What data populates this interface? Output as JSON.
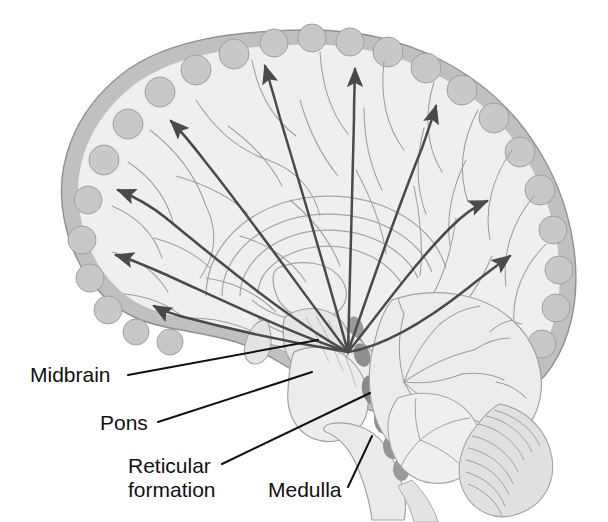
{
  "figure": {
    "view": "mid-sagittal section of the human brain",
    "background_color": "#ffffff",
    "ink_color": "#111111",
    "arrow_color": "#4a4a4a",
    "cortex_fill": "#ededed",
    "cortex_rim": "#a8a8a8",
    "brainstem_fill": "#e2e2e2",
    "nucleus_color": "#8d8d8d"
  },
  "labels": [
    {
      "id": "midbrain",
      "text": "Midbrain",
      "text_x": 30,
      "text_y": 382,
      "leader_from_x": 128,
      "leader_from_y": 375,
      "leader_to_x": 318,
      "leader_to_y": 340
    },
    {
      "id": "pons",
      "text": "Pons",
      "text_x": 100,
      "text_y": 430,
      "leader_from_x": 158,
      "leader_from_y": 422,
      "leader_to_x": 312,
      "leader_to_y": 372
    },
    {
      "id": "reticular-formation",
      "text_line1": "Reticular",
      "text_line2": "formation",
      "text_x": 128,
      "text_y": 473,
      "text_y2": 497,
      "leader_from_x": 222,
      "leader_from_y": 464,
      "leader_to_x": 370,
      "leader_to_y": 393
    },
    {
      "id": "medulla",
      "text": "Medulla",
      "text_x": 268,
      "text_y": 497,
      "leader_from_x": 348,
      "leader_from_y": 487,
      "leader_to_x": 372,
      "leader_to_y": 436
    }
  ],
  "projection_arrows": {
    "count": 9,
    "origin_x": 348,
    "origin_y": 352,
    "description": "ascending reticular activating system fibers fanning from the brainstem to the cerebral cortex",
    "targets": [
      {
        "index": 1,
        "tip_x": 152,
        "tip_y": 305,
        "direction": "anterior-inferior"
      },
      {
        "index": 2,
        "tip_x": 112,
        "tip_y": 253,
        "direction": "anterior"
      },
      {
        "index": 3,
        "tip_x": 114,
        "tip_y": 188,
        "direction": "anterior-superior"
      },
      {
        "index": 4,
        "tip_x": 168,
        "tip_y": 118,
        "direction": "frontal-superior"
      },
      {
        "index": 5,
        "tip_x": 263,
        "tip_y": 62,
        "direction": "superior"
      },
      {
        "index": 6,
        "tip_x": 355,
        "tip_y": 66,
        "direction": "superior"
      },
      {
        "index": 7,
        "tip_x": 438,
        "tip_y": 102,
        "direction": "posterior-superior"
      },
      {
        "index": 8,
        "tip_x": 490,
        "tip_y": 200,
        "direction": "posterior"
      },
      {
        "index": 9,
        "tip_x": 514,
        "tip_y": 253,
        "direction": "posterior-inferior"
      }
    ]
  },
  "reticular_nuclei": {
    "count": 6,
    "note": "chain of dark oval nuclei descending through the brainstem tegmentum",
    "ovals": [
      {
        "cx": 356,
        "cy": 327,
        "rx": 7,
        "ry": 11,
        "rot": -22
      },
      {
        "cx": 362,
        "cy": 355,
        "rx": 8,
        "ry": 12,
        "rot": -18
      },
      {
        "cx": 372,
        "cy": 390,
        "rx": 10,
        "ry": 15,
        "rot": -12
      },
      {
        "cx": 383,
        "cy": 421,
        "rx": 9,
        "ry": 13,
        "rot": -10
      },
      {
        "cx": 392,
        "cy": 447,
        "rx": 9,
        "ry": 12,
        "rot": -8
      },
      {
        "cx": 401,
        "cy": 470,
        "rx": 8,
        "ry": 11,
        "rot": -6
      }
    ]
  },
  "structures": [
    {
      "id": "cerebral-cortex",
      "name": "cerebral cortex"
    },
    {
      "id": "corpus-callosum",
      "name": "corpus callosum"
    },
    {
      "id": "cerebellum",
      "name": "cerebellum"
    },
    {
      "id": "brainstem",
      "name": "brainstem"
    },
    {
      "id": "midbrain-body",
      "name": "midbrain"
    },
    {
      "id": "pons-body",
      "name": "pons"
    },
    {
      "id": "medulla-body",
      "name": "medulla oblongata"
    },
    {
      "id": "spinal-cord",
      "name": "spinal cord"
    }
  ]
}
